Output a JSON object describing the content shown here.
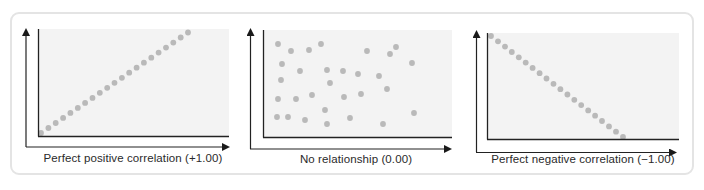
{
  "figure": {
    "panels": [
      {
        "id": "positive",
        "caption": "Perfect positive correlation (+1.00)",
        "coefficient": "+1.00"
      },
      {
        "id": "none",
        "caption": "No relationship (0.00)",
        "coefficient": "0.00"
      },
      {
        "id": "negative",
        "caption": "Perfect negative correlation (−1.00)",
        "coefficient": "−1.00"
      }
    ]
  },
  "colors": {
    "dot": "#b9b9b9",
    "plot_area": "#f3f3f3",
    "axis": "#222222",
    "frame_border": "#e4e4e4"
  }
}
